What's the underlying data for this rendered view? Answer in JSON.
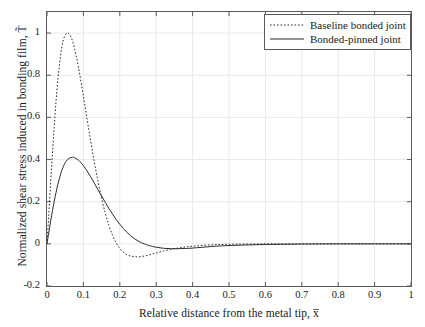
{
  "chart_data": {
    "type": "line",
    "title": "",
    "xlabel": "Relative distance from the metal tip, x̅",
    "ylabel": "Normalized shear stress induced in bonding film, T̃",
    "xlim": [
      0,
      1
    ],
    "ylim": [
      -0.2,
      1.1
    ],
    "xticks": [
      "0",
      "0.1",
      "0.2",
      "0.3",
      "0.4",
      "0.5",
      "0.6",
      "0.7",
      "0.8",
      "0.9",
      "1"
    ],
    "xtick_values": [
      0,
      0.1,
      0.2,
      0.3,
      0.4,
      0.5,
      0.6,
      0.7,
      0.8,
      0.9,
      1
    ],
    "yticks": [
      "-0.2",
      "0",
      "0.2",
      "0.4",
      "0.6",
      "0.8",
      "1"
    ],
    "ytick_values": [
      -0.2,
      0,
      0.2,
      0.4,
      0.6,
      0.8,
      1
    ],
    "grid": true,
    "legend_position": "top-right",
    "series": [
      {
        "name": "Baseline bonded joint",
        "style": "dotted",
        "color": "#2b2b2b",
        "x": [
          0,
          0.005,
          0.01,
          0.015,
          0.02,
          0.025,
          0.03,
          0.035,
          0.04,
          0.045,
          0.05,
          0.055,
          0.06,
          0.065,
          0.07,
          0.075,
          0.08,
          0.085,
          0.09,
          0.1,
          0.11,
          0.12,
          0.13,
          0.14,
          0.15,
          0.16,
          0.17,
          0.18,
          0.19,
          0.2,
          0.21,
          0.22,
          0.23,
          0.24,
          0.25,
          0.26,
          0.27,
          0.28,
          0.29,
          0.3,
          0.32,
          0.34,
          0.36,
          0.38,
          0.4,
          0.45,
          0.5,
          0.6,
          0.7,
          0.8,
          0.9,
          1
        ],
        "y": [
          0,
          0.14,
          0.29,
          0.43,
          0.56,
          0.68,
          0.78,
          0.86,
          0.925,
          0.968,
          0.99,
          1.0,
          0.998,
          0.985,
          0.963,
          0.932,
          0.894,
          0.851,
          0.804,
          0.7,
          0.593,
          0.488,
          0.388,
          0.297,
          0.216,
          0.146,
          0.088,
          0.041,
          0.005,
          -0.022,
          -0.04,
          -0.052,
          -0.058,
          -0.061,
          -0.062,
          -0.06,
          -0.057,
          -0.053,
          -0.048,
          -0.043,
          -0.034,
          -0.026,
          -0.02,
          -0.015,
          -0.011,
          -0.005,
          -0.002,
          0,
          0,
          0,
          0,
          0
        ]
      },
      {
        "name": "Bonded-pinned joint",
        "style": "solid",
        "color": "#2b2b2b",
        "x": [
          0,
          0.005,
          0.01,
          0.015,
          0.02,
          0.025,
          0.03,
          0.035,
          0.04,
          0.05,
          0.06,
          0.07,
          0.075,
          0.08,
          0.085,
          0.09,
          0.1,
          0.11,
          0.12,
          0.13,
          0.14,
          0.15,
          0.16,
          0.17,
          0.18,
          0.19,
          0.2,
          0.21,
          0.22,
          0.23,
          0.24,
          0.25,
          0.26,
          0.27,
          0.28,
          0.3,
          0.32,
          0.34,
          0.36,
          0.38,
          0.4,
          0.45,
          0.5,
          0.6,
          0.7,
          0.8,
          0.9,
          1
        ],
        "y": [
          0,
          0.055,
          0.108,
          0.157,
          0.203,
          0.245,
          0.283,
          0.316,
          0.345,
          0.385,
          0.405,
          0.411,
          0.409,
          0.405,
          0.399,
          0.391,
          0.371,
          0.346,
          0.318,
          0.288,
          0.257,
          0.227,
          0.197,
          0.168,
          0.141,
          0.116,
          0.093,
          0.072,
          0.054,
          0.038,
          0.025,
          0.014,
          0.005,
          -0.002,
          -0.008,
          -0.016,
          -0.021,
          -0.023,
          -0.023,
          -0.022,
          -0.02,
          -0.013,
          -0.008,
          -0.003,
          -0.001,
          0,
          0,
          0
        ]
      }
    ]
  },
  "legend": {
    "entries": [
      {
        "label": "Baseline bonded joint"
      },
      {
        "label": "Bonded-pinned joint"
      }
    ]
  },
  "colors": {
    "axis": "#5a5a5a",
    "grid": "#e9e9e9",
    "curve": "#2b2b2b",
    "text": "#1a1a1a"
  }
}
